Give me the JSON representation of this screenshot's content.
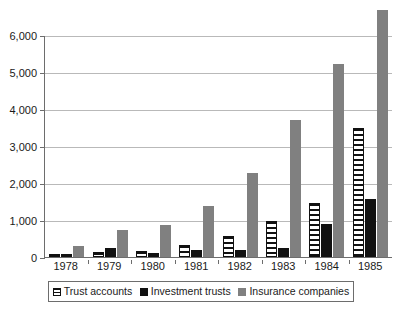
{
  "chart_data": {
    "type": "bar",
    "title": "",
    "subtitle": "",
    "xlabel": "",
    "ylabel": "",
    "categories": [
      "1978",
      "1979",
      "1980",
      "1981",
      "1982",
      "1983",
      "1984",
      "1985"
    ],
    "series": [
      {
        "name": "Trust accounts",
        "color": "#ffffff",
        "pattern": "horizontal-stripes",
        "values": [
          80,
          140,
          160,
          320,
          570,
          960,
          1450,
          3480
        ]
      },
      {
        "name": "Investment trusts",
        "color": "#111111",
        "pattern": "solid",
        "values": [
          90,
          250,
          110,
          200,
          180,
          240,
          900,
          1560
        ]
      },
      {
        "name": "Insurance companies",
        "color": "#808080",
        "pattern": "solid",
        "values": [
          290,
          730,
          870,
          1370,
          2260,
          3710,
          5230,
          6670
        ]
      }
    ],
    "ylim": [
      0,
      6000
    ],
    "yticks": [
      0,
      1000,
      2000,
      3000,
      4000,
      5000,
      6000
    ],
    "ytick_labels": [
      "0",
      "1,000",
      "2,000",
      "3,000",
      "4,000",
      "5,000",
      "6,000"
    ],
    "grid": true,
    "grid_axis": "y",
    "legend_position": "bottom",
    "legend": [
      "Trust accounts",
      "Investment trusts",
      "Insurance companies"
    ]
  }
}
